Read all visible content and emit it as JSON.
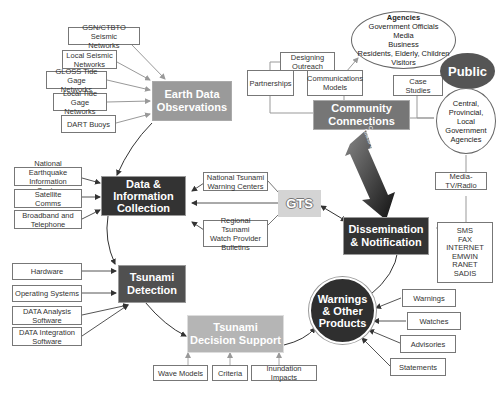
{
  "diagram": {
    "nodes": {
      "earth_data_observations": "Earth Data\nObservations",
      "data_information_collection": "Data &\nInformation\nCollection",
      "tsunami_detection": "Tsunami\nDetection",
      "tsunami_decision_support": "Tsunami\nDecision Support",
      "warnings_other_products": "Warnings\n& Other\nProducts",
      "dissemination_notification": "Dissemination\n& Notification",
      "community_connections": "Community\nConnections",
      "public": "Public",
      "gts": "GTS"
    },
    "earth_data_inputs": [
      "GSN/CTBTO Seismic\nNetworks",
      "Local Seismic\nNetworks",
      "GLOSS Tide Gage\nNetworks",
      "Local Tide Gage\nNetworks",
      "DART Buoys"
    ],
    "collection_inputs": [
      "National Earthquake\nInformation Center",
      "Satellite\nComms",
      "Broadband and\nTelephone"
    ],
    "gts_inputs": [
      "National Tsunami\nWarning Centers",
      "Regional Tsunami\nWatch Provider\nBulletins"
    ],
    "detection_inputs": [
      "Hardware",
      "Operating Systems",
      "DATA Analysis\nSoftware",
      "DATA Integration\nSoftware"
    ],
    "decision_support_inputs": [
      "Wave Models",
      "Criteria",
      "Inundation Impacts"
    ],
    "product_types": [
      "Warnings",
      "Watches",
      "Advisories",
      "Statements"
    ],
    "community_items": [
      "Designing\nOutreach",
      "Partnerships",
      "Communications\nModels",
      "Case Studies"
    ],
    "agencies_ellipse": {
      "title": "Agencies",
      "lines": [
        "Government Officials",
        "Media",
        "Business",
        "Residents, Elderly, Children",
        "Visitors"
      ]
    },
    "government_circle": "Central,\nProvincial,\nLocal\nGovernment\nAgencies",
    "media_box": "Media-\nTV/Radio",
    "channels_box": "SMS\nFAX\nINTERNET\nEMWIN\nRANET\nSADIS",
    "feedback_arrow_label": "Communications\nLinks/Feedback"
  }
}
